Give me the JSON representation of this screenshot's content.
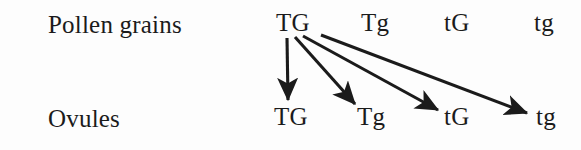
{
  "figure": {
    "background_color": "#fdfdfd",
    "ink_color": "#1b1b1b",
    "rows": {
      "pollen": {
        "label": "Pollen grains",
        "genotypes": [
          "TG",
          "Tg",
          "tG",
          "tg"
        ]
      },
      "ovules": {
        "label": "Ovules",
        "genotypes": [
          "TG",
          "Tg",
          "tG",
          "tg"
        ]
      }
    },
    "arrows": [
      {
        "name": "arrow-TG-to-TG",
        "from": "TG",
        "to": "TG",
        "x1": 287,
        "y1": 38,
        "x2": 288,
        "y2": 100
      },
      {
        "name": "arrow-TG-to-Tg",
        "from": "TG",
        "to": "Tg",
        "x1": 295,
        "y1": 37,
        "x2": 355,
        "y2": 104
      },
      {
        "name": "arrow-TG-to-tG",
        "from": "TG",
        "to": "tG",
        "x1": 303,
        "y1": 36,
        "x2": 438,
        "y2": 110
      },
      {
        "name": "arrow-TG-to-tg",
        "from": "TG",
        "to": "tg",
        "x1": 321,
        "y1": 35,
        "x2": 527,
        "y2": 113
      }
    ]
  }
}
